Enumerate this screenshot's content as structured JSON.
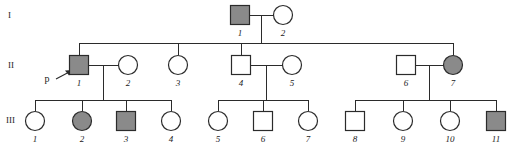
{
  "figure": {
    "type": "pedigree-chart",
    "width": 513,
    "height": 150,
    "background": "#ffffff"
  },
  "legend_colors": {
    "affected_fill": "#8a8a8a",
    "unaffected_fill": "#ffffff",
    "stroke": "#2b2b2b",
    "text": "#1a1a1a"
  },
  "generation_labels": [
    {
      "text": "I",
      "x": 8,
      "y": 18
    },
    {
      "text": "II",
      "x": 8,
      "y": 68
    },
    {
      "text": "III",
      "x": 6,
      "y": 123
    }
  ],
  "proband": {
    "label": "p",
    "label_x": 47,
    "label_y": 82,
    "points_to": "II-1"
  },
  "individuals": [
    {
      "id": "I-1",
      "number": "1",
      "generation": "I",
      "sex": "male",
      "affected": true,
      "cx": 240,
      "cy": 15,
      "label_x": 240,
      "label_y": 36
    },
    {
      "id": "I-2",
      "number": "2",
      "generation": "I",
      "sex": "female",
      "affected": false,
      "cx": 283,
      "cy": 15,
      "label_x": 283,
      "label_y": 36
    },
    {
      "id": "II-1",
      "number": "1",
      "generation": "II",
      "sex": "male",
      "affected": true,
      "cx": 79,
      "cy": 65,
      "label_x": 79,
      "label_y": 86
    },
    {
      "id": "II-2",
      "number": "2",
      "generation": "II",
      "sex": "female",
      "affected": false,
      "cx": 128,
      "cy": 65,
      "label_x": 128,
      "label_y": 86
    },
    {
      "id": "II-3",
      "number": "3",
      "generation": "II",
      "sex": "female",
      "affected": false,
      "cx": 178,
      "cy": 65,
      "label_x": 178,
      "label_y": 86
    },
    {
      "id": "II-4",
      "number": "4",
      "generation": "II",
      "sex": "male",
      "affected": false,
      "cx": 241,
      "cy": 65,
      "label_x": 241,
      "label_y": 86
    },
    {
      "id": "II-5",
      "number": "5",
      "generation": "II",
      "sex": "female",
      "affected": false,
      "cx": 292,
      "cy": 65,
      "label_x": 292,
      "label_y": 86
    },
    {
      "id": "II-6",
      "number": "6",
      "generation": "II",
      "sex": "male",
      "affected": false,
      "cx": 406,
      "cy": 65,
      "label_x": 406,
      "label_y": 86
    },
    {
      "id": "II-7",
      "number": "7",
      "generation": "II",
      "sex": "female",
      "affected": true,
      "cx": 453,
      "cy": 65,
      "label_x": 453,
      "label_y": 86
    },
    {
      "id": "III-1",
      "number": "1",
      "generation": "III",
      "sex": "female",
      "affected": false,
      "cx": 35,
      "cy": 121,
      "label_x": 35,
      "label_y": 142
    },
    {
      "id": "III-2",
      "number": "2",
      "generation": "III",
      "sex": "female",
      "affected": true,
      "cx": 82,
      "cy": 121,
      "label_x": 82,
      "label_y": 142
    },
    {
      "id": "III-3",
      "number": "3",
      "generation": "III",
      "sex": "male",
      "affected": true,
      "cx": 126,
      "cy": 121,
      "label_x": 126,
      "label_y": 142
    },
    {
      "id": "III-4",
      "number": "4",
      "generation": "III",
      "sex": "female",
      "affected": false,
      "cx": 171,
      "cy": 121,
      "label_x": 171,
      "label_y": 142
    },
    {
      "id": "III-5",
      "number": "5",
      "generation": "III",
      "sex": "female",
      "affected": false,
      "cx": 218,
      "cy": 121,
      "label_x": 218,
      "label_y": 142
    },
    {
      "id": "III-6",
      "number": "6",
      "generation": "III",
      "sex": "male",
      "affected": false,
      "cx": 263,
      "cy": 121,
      "label_x": 263,
      "label_y": 142
    },
    {
      "id": "III-7",
      "number": "7",
      "generation": "III",
      "sex": "female",
      "affected": false,
      "cx": 308,
      "cy": 121,
      "label_x": 308,
      "label_y": 142
    },
    {
      "id": "III-8",
      "number": "8",
      "generation": "III",
      "sex": "male",
      "affected": false,
      "cx": 355,
      "cy": 121,
      "label_x": 355,
      "label_y": 142
    },
    {
      "id": "III-9",
      "number": "9",
      "generation": "III",
      "sex": "female",
      "affected": false,
      "cx": 403,
      "cy": 121,
      "label_x": 403,
      "label_y": 142
    },
    {
      "id": "III-10",
      "number": "10",
      "generation": "III",
      "sex": "female",
      "affected": false,
      "cx": 450,
      "cy": 121,
      "label_x": 450,
      "label_y": 142
    },
    {
      "id": "III-11",
      "number": "11",
      "generation": "III",
      "sex": "male",
      "affected": true,
      "cx": 496,
      "cy": 121,
      "label_x": 496,
      "label_y": 142
    }
  ],
  "connector_paths": [
    "M 250 15 L 273 15",
    "M 261.5 15 L 261.5 43",
    "M 79 43 L 453 43",
    "M 79 43 L 79 55",
    "M 178 43 L 178 55",
    "M 241 43 L 241 55",
    "M 453 43 L 453 55",
    "M 89 65 L 118 65",
    "M 103.5 65 L 103.5 100",
    "M 35 100 L 171 100",
    "M 35 100 L 35 111",
    "M 82 100 L 82 111",
    "M 126 100 L 126 111",
    "M 171 100 L 171 111",
    "M 251 65 L 282 65",
    "M 266 65 L 266 100",
    "M 218 100 L 308 100",
    "M 218 100 L 218 111",
    "M 263 100 L 263 111",
    "M 308 100 L 308 111",
    "M 416 65 L 443 65",
    "M 429.5 65 L 429.5 100",
    "M 355 100 L 496 100",
    "M 355 100 L 355 111",
    "M 403 100 L 403 111",
    "M 450 100 L 450 111",
    "M 496 100 L 496 111"
  ],
  "proband_arrow": {
    "shaft": "M 56 79 L 73 70",
    "head_points": "73,70 65,70.5 69,75.5"
  },
  "symbol_geometry": {
    "square_size": 19,
    "circle_radius": 9.5
  }
}
